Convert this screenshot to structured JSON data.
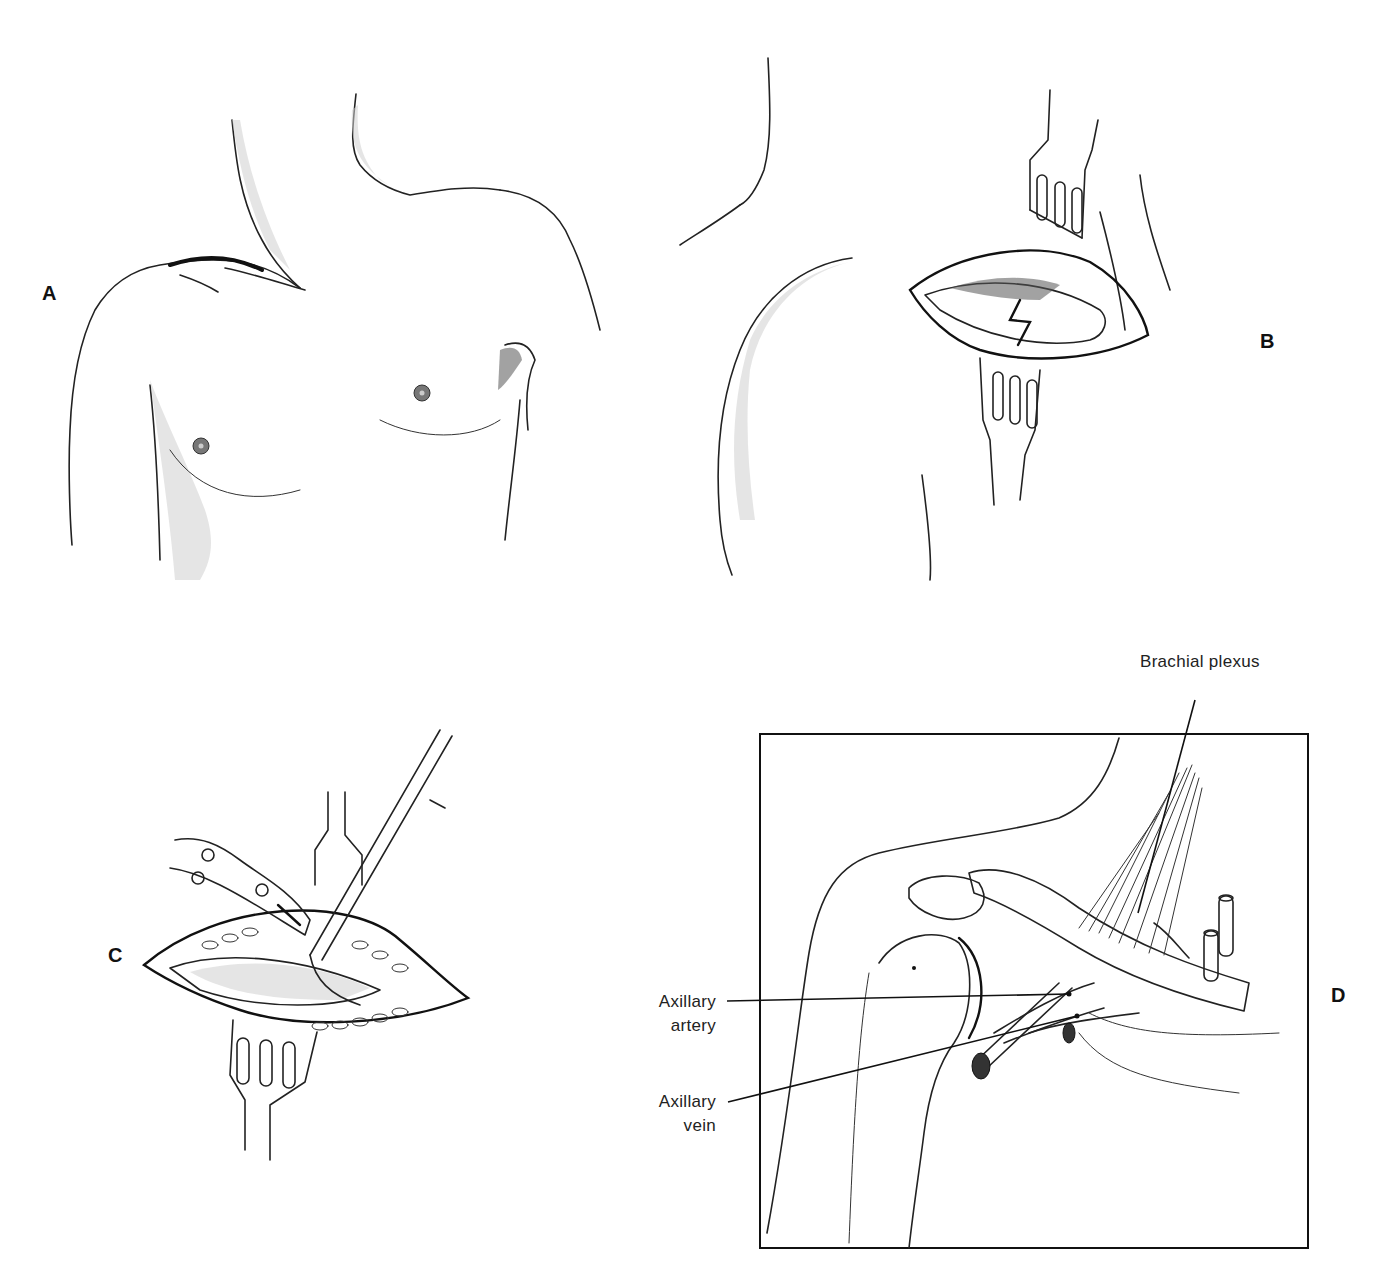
{
  "figure": {
    "panels": [
      {
        "id": "A",
        "letter": "A",
        "subject": "anterior chest and shoulders, intact skin with incision line below clavicle"
      },
      {
        "id": "B",
        "letter": "B",
        "subject": "shoulder with opened incision held by two retractors"
      },
      {
        "id": "C",
        "letter": "C",
        "subject": "opened incision with retractor, clamp and instrument inserted"
      },
      {
        "id": "D",
        "letter": "D",
        "subject": "framed anatomical view of shoulder showing vessels and nerves"
      }
    ],
    "labels": {
      "brachial_plexus": "Brachial plexus",
      "axillary_artery_line1": "Axillary",
      "axillary_artery_line2": "artery",
      "axillary_vein_line1": "Axillary",
      "axillary_vein_line2": "vein"
    },
    "colors": {
      "background": "#ffffff",
      "ink": "#222222",
      "frame": "#111111"
    }
  }
}
